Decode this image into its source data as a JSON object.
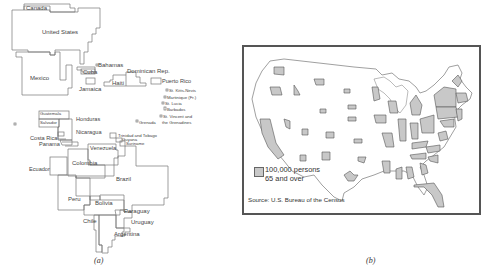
{
  "panel_a": {
    "caption": "(a)",
    "labels": {
      "canada": "Canada",
      "united_states": "United States",
      "mexico": "Mexico",
      "bahamas": "Bahamas",
      "cuba": "Cuba",
      "jamaica": "Jamaica",
      "haiti": "Haiti",
      "dominican_rep": "Dominican Rep.",
      "puerto_rico": "Puerto Rico",
      "st_kitts": "St. Kitts-Nevis",
      "martinique": "Martinique (Fr.)",
      "st_lucia": "St. Lucia",
      "barbados": "Barbados",
      "st_vincent_1": "St. Vincent and",
      "st_vincent_2": "the Grenadines",
      "grenada": "Grenada",
      "guatemala": "Guatemala",
      "salvador": "Salvador",
      "honduras": "Honduras",
      "nicaragua": "Nicaragua",
      "costa_rica": "Costa Rica",
      "panama": "Panama",
      "trinidad": "Trinidad and Tobago",
      "guyana": "Guyana",
      "suriname": "Suriname",
      "venezuela": "Venezuela",
      "colombia": "Colombia",
      "ecuador": "Ecuador",
      "brazil": "Brazil",
      "peru": "Peru",
      "bolivia": "Bolivia",
      "paraguay": "Paraguay",
      "chile": "Chile",
      "uruguay": "Uruguay",
      "argentina": "Argentina"
    }
  },
  "panel_b": {
    "caption": "(b)",
    "legend_line1": "100,000 persons",
    "legend_line2": "65 and over",
    "source": "Source: U.S. Bureau of the Census",
    "colors": {
      "fill": "#c8c8c8",
      "stroke": "#666666",
      "frame": "#555555"
    }
  }
}
